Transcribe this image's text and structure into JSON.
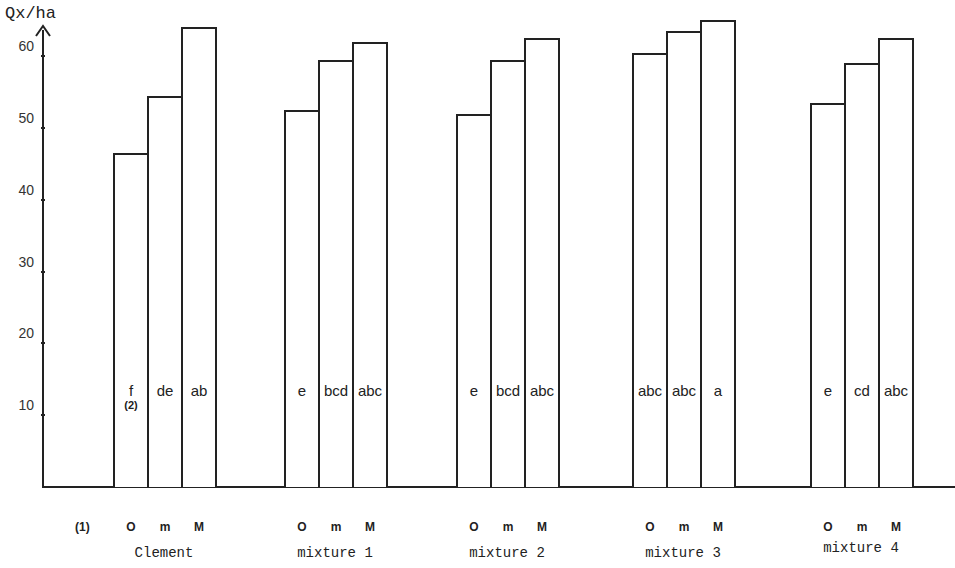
{
  "chart_data": {
    "type": "bar",
    "title": "",
    "ylabel": "Qx/ha",
    "xlabel": "",
    "ylim": [
      0,
      65
    ],
    "yticks": [
      10,
      20,
      30,
      40,
      50,
      60
    ],
    "grid": false,
    "legend": null,
    "x_footnote": "(1)",
    "bar_footnote": "(2)",
    "subcategories": [
      "O",
      "m",
      "M"
    ],
    "categories": [
      "Clement",
      "mixture 1",
      "mixture 2",
      "mixture 3",
      "mixture 4"
    ],
    "groups": [
      {
        "name": "Clement",
        "bars": [
          {
            "code": "O",
            "value": 46.5,
            "letters": "f",
            "note": "(2)"
          },
          {
            "code": "m",
            "value": 54.5,
            "letters": "de"
          },
          {
            "code": "M",
            "value": 64.0,
            "letters": "ab"
          }
        ]
      },
      {
        "name": "mixture 1",
        "bars": [
          {
            "code": "O",
            "value": 52.5,
            "letters": "e"
          },
          {
            "code": "m",
            "value": 59.5,
            "letters": "bcd"
          },
          {
            "code": "M",
            "value": 62.0,
            "letters": "abc"
          }
        ]
      },
      {
        "name": "mixture 2",
        "bars": [
          {
            "code": "O",
            "value": 52.0,
            "letters": "e"
          },
          {
            "code": "m",
            "value": 59.5,
            "letters": "bcd"
          },
          {
            "code": "M",
            "value": 62.5,
            "letters": "abc"
          }
        ]
      },
      {
        "name": "mixture 3",
        "bars": [
          {
            "code": "O",
            "value": 60.5,
            "letters": "abc"
          },
          {
            "code": "m",
            "value": 63.5,
            "letters": "abc"
          },
          {
            "code": "M",
            "value": 65.0,
            "letters": "a"
          }
        ]
      },
      {
        "name": "mixture 4",
        "bars": [
          {
            "code": "O",
            "value": 53.5,
            "letters": "e"
          },
          {
            "code": "m",
            "value": 59.0,
            "letters": "cd"
          },
          {
            "code": "M",
            "value": 62.5,
            "letters": "abc"
          }
        ]
      }
    ],
    "series": [
      {
        "name": "O",
        "values": [
          46.5,
          52.5,
          52.0,
          60.5,
          53.5
        ]
      },
      {
        "name": "m",
        "values": [
          54.5,
          59.5,
          59.5,
          63.5,
          59.0
        ]
      },
      {
        "name": "M",
        "values": [
          64.0,
          62.0,
          62.5,
          65.0,
          62.5
        ]
      }
    ]
  }
}
